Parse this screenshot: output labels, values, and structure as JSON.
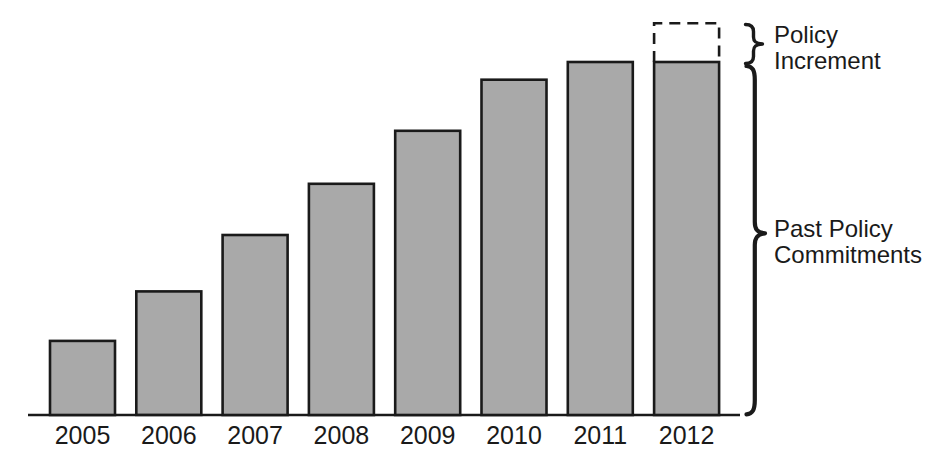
{
  "figure": {
    "background": "#ffffff",
    "bar_fill": "#a9a9a9",
    "line_color": "#1a1a1a",
    "text_color": "#1a1a1a"
  },
  "chart_data": {
    "type": "bar",
    "categories": [
      "2005",
      "2006",
      "2007",
      "2008",
      "2009",
      "2010",
      "2011",
      "2012"
    ],
    "values": [
      21,
      35,
      51,
      65.5,
      80.5,
      95,
      100,
      100
    ],
    "value_units": "relative index (no numeric y-axis shown; 2011 bar = 100)",
    "title": "",
    "xlabel": "",
    "ylabel": "",
    "ylim": [
      0,
      115
    ],
    "grid": false,
    "legend": "none",
    "y_axis": "none",
    "increment_overlay": {
      "category": "2012",
      "value": 11,
      "rendering": "dashed outline box stacked on top of the 2012 bar"
    }
  },
  "annotations": {
    "policy_increment": {
      "line1": "Policy",
      "line2": "Increment"
    },
    "past_policy": {
      "line1": "Past Policy",
      "line2": "Commitments"
    }
  }
}
